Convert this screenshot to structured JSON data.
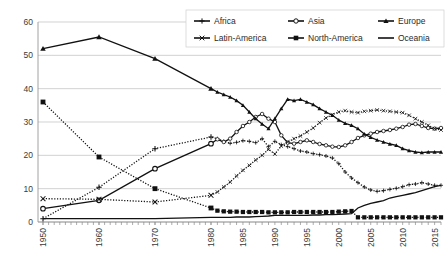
{
  "chart_data": {
    "type": "line",
    "title": "",
    "xlabel": "",
    "ylabel": "",
    "ylim": [
      0,
      60
    ],
    "yticks": [
      0,
      10,
      20,
      30,
      40,
      50,
      60
    ],
    "grid": true,
    "legend_position": "top-right",
    "x_tick_labels": [
      "1950",
      "1960",
      "1970",
      "1980",
      "1985",
      "1990",
      "1995",
      "2000",
      "2005",
      "2010",
      "2015"
    ],
    "x_tick_values": [
      1950,
      1960,
      1970,
      1980,
      1985,
      1990,
      1995,
      2000,
      2005,
      2010,
      2015
    ],
    "x": [
      1950,
      1960,
      1970,
      1980,
      1981,
      1982,
      1983,
      1984,
      1985,
      1986,
      1987,
      1988,
      1989,
      1990,
      1991,
      1992,
      1993,
      1994,
      1995,
      1996,
      1997,
      1998,
      1999,
      2000,
      2001,
      2002,
      2003,
      2004,
      2005,
      2006,
      2007,
      2008,
      2009,
      2010,
      2011,
      2012,
      2013,
      2014,
      2015,
      2016
    ],
    "series": [
      {
        "name": "Africa",
        "marker": "plus",
        "line_style": "dotted",
        "color": "#111111",
        "values": [
          1.0,
          10.4,
          22.0,
          25.5,
          25.0,
          24.2,
          23.6,
          23.9,
          24.4,
          24.2,
          23.8,
          25.0,
          22.6,
          24.2,
          23.2,
          22.6,
          22.0,
          21.3,
          21.0,
          20.5,
          20.2,
          19.8,
          19.2,
          17.5,
          15.0,
          13.2,
          11.8,
          10.5,
          9.6,
          9.2,
          9.4,
          9.8,
          10.1,
          10.6,
          11.2,
          11.4,
          11.8,
          11.4,
          11.0,
          11.0
        ]
      },
      {
        "name": "Asia",
        "marker": "circle",
        "line_style": "solid",
        "color": "#111111",
        "values": [
          4.0,
          6.5,
          16.0,
          23.5,
          24.8,
          24.0,
          25.0,
          27.0,
          28.8,
          30.0,
          31.5,
          32.4,
          31.0,
          30.0,
          26.0,
          23.8,
          23.5,
          24.0,
          24.5,
          24.0,
          23.4,
          23.0,
          22.6,
          22.5,
          23.0,
          24.0,
          25.2,
          26.0,
          26.5,
          27.0,
          27.3,
          27.6,
          28.0,
          28.5,
          29.2,
          29.4,
          28.8,
          28.2,
          28.0,
          28.2
        ]
      },
      {
        "name": "Europe",
        "marker": "triangle",
        "line_style": "solid",
        "color": "#111111",
        "values": [
          52.0,
          55.5,
          49.0,
          40.0,
          39.0,
          38.2,
          37.5,
          36.4,
          35.0,
          33.0,
          31.0,
          29.4,
          28.0,
          31.0,
          34.0,
          36.8,
          36.4,
          36.8,
          36.0,
          35.2,
          34.0,
          33.0,
          32.0,
          30.6,
          29.6,
          29.0,
          28.0,
          26.4,
          25.4,
          24.6,
          24.0,
          23.4,
          23.0,
          22.0,
          21.4,
          21.0,
          20.8,
          21.0,
          21.0,
          21.0
        ]
      },
      {
        "name": "Latin-America",
        "marker": "x",
        "line_style": "dotted",
        "color": "#111111",
        "values": [
          7.0,
          6.8,
          6.0,
          8.0,
          9.0,
          10.5,
          12.0,
          13.8,
          15.5,
          17.0,
          18.6,
          20.0,
          21.8,
          20.4,
          22.8,
          24.0,
          25.0,
          25.8,
          27.0,
          28.2,
          29.8,
          31.2,
          32.2,
          33.0,
          33.4,
          33.0,
          32.8,
          33.2,
          33.4,
          33.6,
          33.4,
          33.2,
          33.0,
          32.8,
          32.0,
          31.0,
          30.0,
          29.0,
          28.0,
          27.6
        ]
      },
      {
        "name": "North-America",
        "marker": "square-filled",
        "line_style": "dotted",
        "color": "#111111",
        "values": [
          36.0,
          19.5,
          10.0,
          4.2,
          3.4,
          3.2,
          3.1,
          3.1,
          3.0,
          3.0,
          3.0,
          3.0,
          2.9,
          2.9,
          2.9,
          2.9,
          3.0,
          3.0,
          3.0,
          3.0,
          3.0,
          3.0,
          3.0,
          3.1,
          3.2,
          3.3,
          1.4,
          1.4,
          1.4,
          1.4,
          1.4,
          1.4,
          1.4,
          1.4,
          1.4,
          1.4,
          1.4,
          1.4,
          1.4,
          1.4
        ]
      },
      {
        "name": "Oceania",
        "marker": "none",
        "line_style": "solid",
        "color": "#111111",
        "values": [
          1.0,
          1.0,
          1.0,
          1.4,
          1.4,
          1.4,
          1.4,
          1.5,
          1.5,
          1.5,
          1.6,
          1.7,
          1.8,
          2.0,
          2.0,
          2.0,
          2.0,
          2.0,
          2.0,
          2.1,
          2.1,
          2.2,
          2.2,
          2.3,
          2.4,
          2.5,
          4.2,
          5.0,
          5.6,
          6.0,
          6.4,
          7.2,
          7.6,
          8.0,
          8.4,
          8.8,
          9.4,
          10.0,
          10.6,
          11.0
        ]
      }
    ]
  },
  "legend": {
    "entries": [
      {
        "label": "Africa",
        "marker": "plus"
      },
      {
        "label": "Asia",
        "marker": "circle"
      },
      {
        "label": "Europe",
        "marker": "triangle"
      },
      {
        "label": "Latin-America",
        "marker": "x"
      },
      {
        "label": "North-America",
        "marker": "square-filled"
      },
      {
        "label": "Oceania",
        "marker": "none"
      }
    ]
  }
}
